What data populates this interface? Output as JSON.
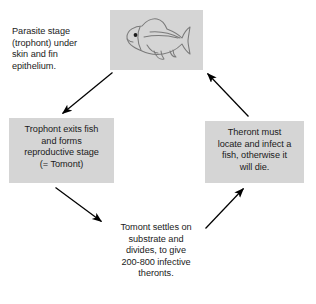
{
  "diagram": {
    "background_color": "#ffffff",
    "box_color": "#d5d5d5",
    "text_color": "#1b1b1b",
    "arrow_color": "#000000",
    "cycle_direction": "counter-clockwise"
  },
  "nodes": {
    "fish": {
      "label": "fish-illustration",
      "boxed": true,
      "icon": "fish-icon"
    },
    "parasite": {
      "boxed": false,
      "lines": [
        "Parasite stage",
        "(trophont) under",
        "skin and fin",
        "epithelium."
      ]
    },
    "trophont": {
      "boxed": true,
      "lines": [
        "Trophont exits fish",
        "and forms",
        "reproductive stage",
        "(= Tomont)"
      ]
    },
    "tomont": {
      "boxed": false,
      "lines": [
        "Tomont settles on",
        "substrate and",
        "divides, to give",
        "200-800 infective",
        "theronts."
      ]
    },
    "theront": {
      "boxed": true,
      "lines": [
        "Theront must",
        "locate and infect a",
        "fish, otherwise it",
        "will die."
      ]
    }
  },
  "arrows": [
    {
      "name": "arrow-fish-to-trophont",
      "from": "fish",
      "to": "trophont",
      "direction": "down-left"
    },
    {
      "name": "arrow-trophont-to-tomont",
      "from": "trophont",
      "to": "tomont",
      "direction": "down-right"
    },
    {
      "name": "arrow-tomont-to-theront",
      "from": "tomont",
      "to": "theront",
      "direction": "up-right"
    },
    {
      "name": "arrow-theront-to-fish",
      "from": "theront",
      "to": "fish",
      "direction": "up-left"
    }
  ]
}
